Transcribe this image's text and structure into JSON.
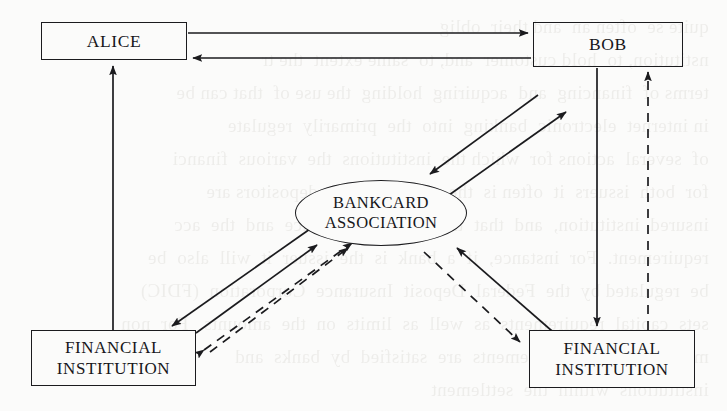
{
  "diagram": {
    "background_color": "#fbfbfa",
    "stroke_color": "#1b1b1e",
    "nodes": [
      {
        "id": "alice",
        "label": "ALICE",
        "shape": "rect",
        "x": 41,
        "y": 22,
        "w": 146,
        "h": 38
      },
      {
        "id": "bob",
        "label": "BOB",
        "shape": "rect",
        "x": 533,
        "y": 22,
        "w": 150,
        "h": 45
      },
      {
        "id": "assoc",
        "label_line1": "BANKCARD",
        "label_line2": "ASSOCIATION",
        "shape": "ellipse",
        "x": 295,
        "y": 180,
        "w": 172,
        "h": 66
      },
      {
        "id": "fi_left",
        "label_line1": "FINANCIAL",
        "label_line2": "INSTITUTION",
        "shape": "rect",
        "x": 31,
        "y": 330,
        "w": 165,
        "h": 56
      },
      {
        "id": "fi_right",
        "label_line1": "FINANCIAL",
        "label_line2": "INSTITUTION",
        "shape": "rect",
        "x": 529,
        "y": 330,
        "w": 166,
        "h": 58
      }
    ],
    "edges": [
      {
        "id": "alice-to-bob",
        "from": "alice",
        "to": "bob",
        "style": "solid",
        "arrow": "end"
      },
      {
        "id": "bob-to-alice",
        "from": "bob",
        "to": "alice",
        "style": "solid",
        "arrow": "end"
      },
      {
        "id": "fileft-to-alice",
        "from": "fi_left",
        "to": "alice",
        "style": "solid",
        "arrow": "end"
      },
      {
        "id": "bob-to-firight",
        "from": "bob",
        "to": "fi_right",
        "style": "solid",
        "arrow": "end"
      },
      {
        "id": "firight-to-bob",
        "from": "fi_right",
        "to": "bob",
        "style": "dashed",
        "arrow": "end"
      },
      {
        "id": "assoc-to-bob",
        "from": "assoc",
        "to": "bob",
        "style": "solid",
        "arrow": "end"
      },
      {
        "id": "bob-to-assoc",
        "from": "bob",
        "to": "assoc",
        "style": "solid",
        "arrow": "end"
      },
      {
        "id": "fileft-to-assoc",
        "from": "fi_left",
        "to": "assoc",
        "style": "solid",
        "arrow": "end"
      },
      {
        "id": "assoc-to-fileft",
        "from": "assoc",
        "to": "fi_left",
        "style": "solid",
        "arrow": "end"
      },
      {
        "id": "assoc-to-fileft-dash",
        "from": "assoc",
        "to": "fi_left",
        "style": "dashed",
        "arrow": "both"
      },
      {
        "id": "firight-to-assoc",
        "from": "fi_right",
        "to": "assoc",
        "style": "solid",
        "arrow": "end"
      },
      {
        "id": "assoc-to-firight",
        "from": "assoc",
        "to": "fi_right",
        "style": "dashed",
        "arrow": "end"
      }
    ],
    "bleed_through_text": "  quite se  often an  and their  oblig\n  nstitution, to  hold customer  and, to  same extent  the tr\n  terms of  financing  and  acquiring  holding  the use of  that can be\n  in internet  electronic  banking  into  the  primarily  regulate\n  of  several  actions for  which the  institutions  the  various  financi\n  for  both  issuers  it  often is  the case that  both  depositors are\n  insured  institution,  and  that  the  deposit  insurance  and  the  acc\n  requirement.  For  instance,  if  a  bank  is  the  issuer  it  will  also  be\n  be  regulated by  the  Federal  Deposit  Insurance  Corporation  (FDIC)\n  sets  capital  requirements  as  well  as  limits  on  the  amounts.  For  non\n  many  of  these  requirements  are  satisfied  by  banks  and\n  institutions  within  the  settlement"
  }
}
